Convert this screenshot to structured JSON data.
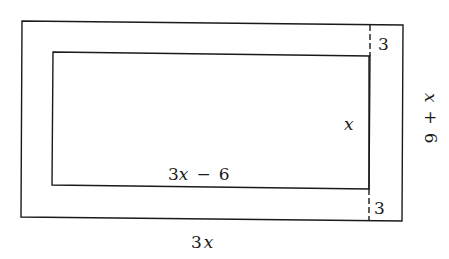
{
  "diagram": {
    "stroke_color": "#1a1a1a",
    "labels": {
      "outer_width": "3x",
      "outer_height": "x + 6",
      "inner_width": "3x − 6",
      "inner_height": "x",
      "top_margin": "3",
      "bottom_margin": "3"
    },
    "outer_width_parts": {
      "coef": "3",
      "var": "x"
    },
    "outer_height_parts": {
      "var": "x",
      "op": "+",
      "const": "6"
    },
    "inner_width_parts": {
      "coef": "3",
      "var": "x",
      "op": "−",
      "const": "6"
    }
  }
}
